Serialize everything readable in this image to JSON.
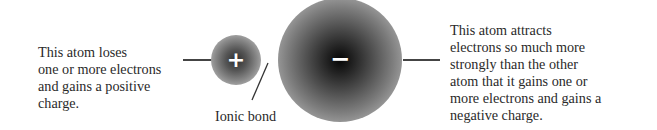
{
  "left_label": {
    "lines": [
      "This atom loses",
      "one or more electrons",
      "and gains a positive",
      "charge."
    ]
  },
  "right_label": {
    "lines": [
      "This atom attracts",
      "electrons so much more",
      "strongly than the other",
      "atom that it gains one or",
      "more electrons and gains a",
      "negative charge."
    ]
  },
  "cation": {
    "sign": "+",
    "name": "positive ion"
  },
  "anion": {
    "sign": "−",
    "name": "negative ion"
  },
  "bond_label": "Ionic bond"
}
